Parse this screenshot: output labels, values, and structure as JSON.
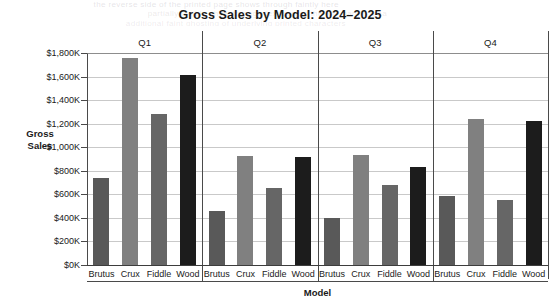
{
  "chart_data": {
    "type": "bar",
    "title": "Gross Sales by Model: 2024–2025",
    "xlabel": "Model",
    "ylabel": "Gross Sales",
    "ylabel_lines": [
      "Gross",
      "Sales"
    ],
    "categories": [
      "Brutus",
      "Crux",
      "Fiddle",
      "Wood"
    ],
    "groups": [
      "Q1",
      "Q2",
      "Q3",
      "Q4"
    ],
    "ylim": [
      0,
      1800
    ],
    "ytick_values": [
      0,
      200,
      400,
      600,
      800,
      1000,
      1200,
      1400,
      1600,
      1800
    ],
    "ytick_labels": [
      "$0K",
      "$200K",
      "$400K",
      "$600K",
      "$800K",
      "$1,000K",
      "$1,200K",
      "$1,400K",
      "$1,600K",
      "$1,800K"
    ],
    "grid": true,
    "legend": "none",
    "value_unit": "thousands of dollars",
    "series": [
      {
        "name": "Brutus",
        "color": "#595959",
        "values": [
          735,
          460,
          400,
          585
        ]
      },
      {
        "name": "Crux",
        "color": "#808080",
        "values": [
          1755,
          925,
          930,
          1240
        ]
      },
      {
        "name": "Fiddle",
        "color": "#666666",
        "values": [
          1280,
          655,
          680,
          550
        ]
      },
      {
        "name": "Wood",
        "color": "#1c1c1c",
        "values": [
          1610,
          920,
          830,
          1225
        ]
      }
    ],
    "bars": [
      {
        "group": "Q1",
        "category": "Brutus",
        "value": 735,
        "color": "#595959"
      },
      {
        "group": "Q1",
        "category": "Crux",
        "value": 1755,
        "color": "#808080"
      },
      {
        "group": "Q1",
        "category": "Fiddle",
        "value": 1280,
        "color": "#666666"
      },
      {
        "group": "Q1",
        "category": "Wood",
        "value": 1610,
        "color": "#1c1c1c"
      },
      {
        "group": "Q2",
        "category": "Brutus",
        "value": 460,
        "color": "#595959"
      },
      {
        "group": "Q2",
        "category": "Crux",
        "value": 925,
        "color": "#808080"
      },
      {
        "group": "Q2",
        "category": "Fiddle",
        "value": 655,
        "color": "#666666"
      },
      {
        "group": "Q2",
        "category": "Wood",
        "value": 920,
        "color": "#1c1c1c"
      },
      {
        "group": "Q3",
        "category": "Brutus",
        "value": 400,
        "color": "#595959"
      },
      {
        "group": "Q3",
        "category": "Crux",
        "value": 930,
        "color": "#808080"
      },
      {
        "group": "Q3",
        "category": "Fiddle",
        "value": 680,
        "color": "#666666"
      },
      {
        "group": "Q3",
        "category": "Wood",
        "value": 830,
        "color": "#1c1c1c"
      },
      {
        "group": "Q4",
        "category": "Brutus",
        "value": 585,
        "color": "#595959"
      },
      {
        "group": "Q4",
        "category": "Crux",
        "value": 1240,
        "color": "#808080"
      },
      {
        "group": "Q4",
        "category": "Fiddle",
        "value": 550,
        "color": "#666666"
      },
      {
        "group": "Q4",
        "category": "Wood",
        "value": 1225,
        "color": "#1c1c1c"
      }
    ]
  },
  "background_artifacts": {
    "note": "faint bleed-through text from reverse side of scanned page",
    "lines": [
      "the reverse side of the printed page shows through faintly here",
      "partially legible show-through text across the top margin area",
      "additional faint ghosting of underlying printed characters"
    ]
  }
}
